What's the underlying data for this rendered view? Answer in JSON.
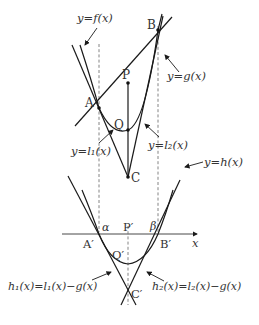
{
  "diagram": {
    "upper": {
      "labels": {
        "f": "y=f(x)",
        "g": "y=g(x)",
        "l1": "y=l₁(x)",
        "l2": "y=l₂(x)"
      },
      "points": {
        "A": "A",
        "B": "B",
        "P": "P",
        "Q": "Q",
        "C": "C"
      }
    },
    "lower": {
      "labels": {
        "h": "y=h(x)",
        "h1": "h₁(x)=l₁(x)−g(x)",
        "h2": "h₂(x)=l₂(x)−g(x)",
        "x_axis": "x",
        "alpha": "α",
        "beta": "β"
      },
      "points": {
        "A": "A′",
        "B": "B′",
        "P": "P′",
        "Q": "Q′",
        "C": "C′"
      }
    }
  }
}
